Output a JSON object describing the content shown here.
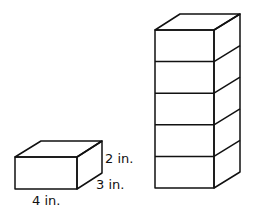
{
  "small_box": {
    "height_label": "2 in.",
    "depth_label": "3 in.",
    "width_label": "4 in."
  },
  "stack": {
    "layers": 5
  }
}
